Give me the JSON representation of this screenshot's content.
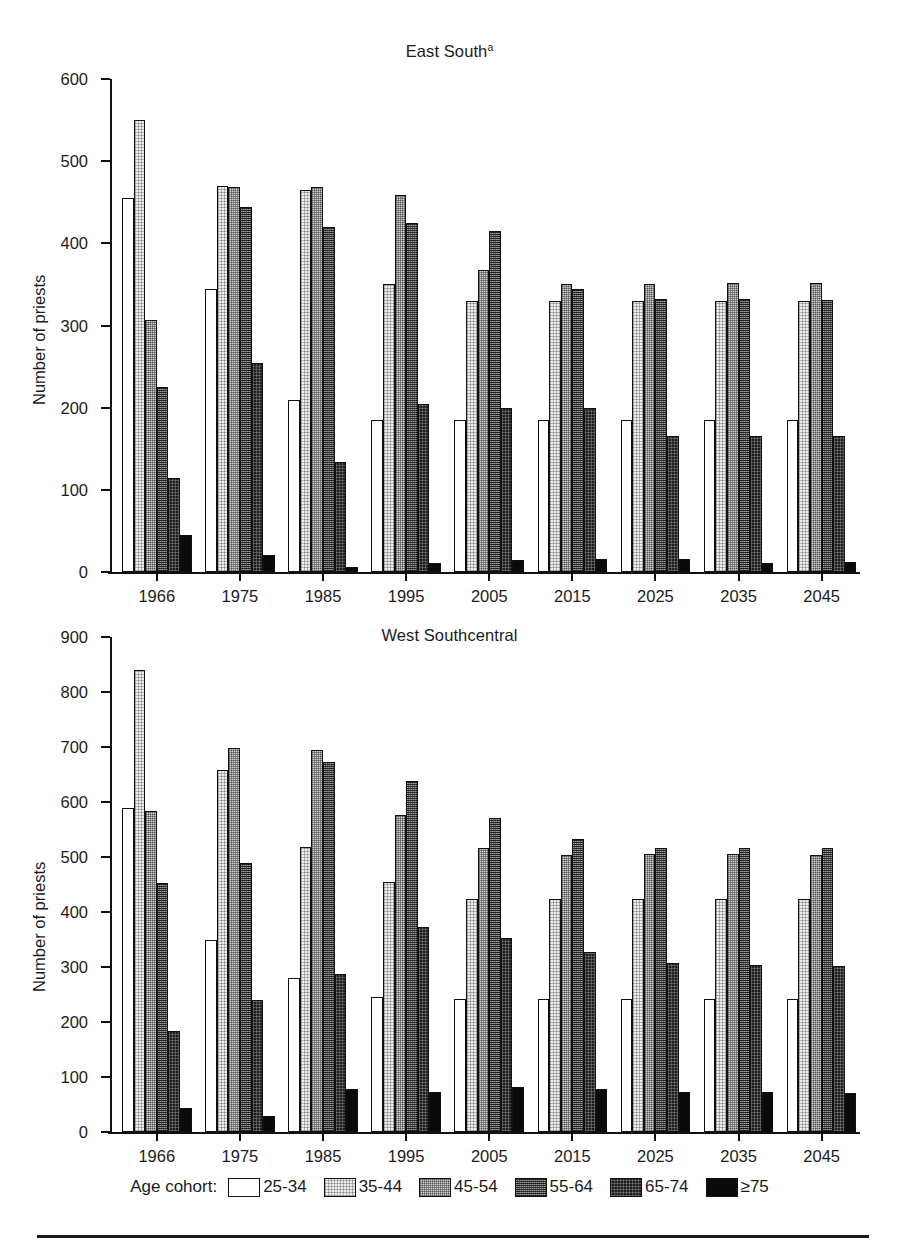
{
  "figure": {
    "ylabel": "Number of priests",
    "legend_caption": "Age cohort:",
    "cohorts": [
      {
        "label": "25-34",
        "fill": "open-white"
      },
      {
        "label": "35-44",
        "fill": "very-light-dither"
      },
      {
        "label": "45-54",
        "fill": "light-dither"
      },
      {
        "label": "55-64",
        "fill": "mid-dark-dither"
      },
      {
        "label": "65-74",
        "fill": "dark-dither"
      },
      {
        "label": "≥75",
        "fill": "solid-black"
      }
    ]
  },
  "chart_data": [
    {
      "type": "bar",
      "panel": "top",
      "title": "East South",
      "title_superscript": "a",
      "xlabel": "",
      "ylabel": "Number of priests",
      "ylim": [
        0,
        600
      ],
      "yticks": [
        0,
        100,
        200,
        300,
        400,
        500,
        600
      ],
      "grid": false,
      "legend_position": "bottom",
      "categories": [
        "1966",
        "1975",
        "1985",
        "1995",
        "2005",
        "2015",
        "2025",
        "2035",
        "2045"
      ],
      "series": [
        {
          "name": "25-34",
          "values": [
            455,
            344,
            209,
            185,
            185,
            185,
            185,
            185,
            185
          ]
        },
        {
          "name": "35-44",
          "values": [
            550,
            470,
            465,
            351,
            330,
            330,
            330,
            330,
            330
          ]
        },
        {
          "name": "45-54",
          "values": [
            307,
            469,
            469,
            459,
            367,
            351,
            351,
            352,
            352
          ]
        },
        {
          "name": "55-64",
          "values": [
            225,
            444,
            420,
            425,
            415,
            345,
            332,
            332,
            331
          ]
        },
        {
          "name": "65-74",
          "values": [
            115,
            254,
            134,
            205,
            200,
            200,
            165,
            165,
            165
          ]
        },
        {
          "name": "≥75",
          "values": [
            45,
            21,
            6,
            11,
            15,
            16,
            16,
            11,
            12
          ]
        }
      ]
    },
    {
      "type": "bar",
      "panel": "bottom",
      "title": "West Southcentral",
      "title_superscript": "",
      "xlabel": "",
      "ylabel": "Number of priests",
      "ylim": [
        0,
        900
      ],
      "yticks": [
        0,
        100,
        200,
        300,
        400,
        500,
        600,
        700,
        800,
        900
      ],
      "grid": false,
      "legend_position": "bottom",
      "categories": [
        "1966",
        "1975",
        "1985",
        "1995",
        "2005",
        "2015",
        "2025",
        "2035",
        "2045"
      ],
      "series": [
        {
          "name": "25-34",
          "values": [
            589,
            350,
            280,
            245,
            242,
            242,
            242,
            242,
            241
          ]
        },
        {
          "name": "35-44",
          "values": [
            840,
            659,
            519,
            455,
            424,
            424,
            424,
            423,
            423
          ]
        },
        {
          "name": "45-54",
          "values": [
            583,
            699,
            694,
            576,
            517,
            504,
            505,
            505,
            503
          ]
        },
        {
          "name": "55-64",
          "values": [
            452,
            489,
            673,
            638,
            571,
            532,
            516,
            516,
            516
          ]
        },
        {
          "name": "65-74",
          "values": [
            184,
            240,
            288,
            373,
            352,
            327,
            307,
            303,
            302
          ]
        },
        {
          "name": "≥75",
          "values": [
            44,
            30,
            79,
            73,
            82,
            78,
            73,
            72,
            71
          ]
        }
      ]
    }
  ]
}
